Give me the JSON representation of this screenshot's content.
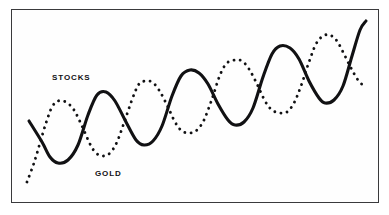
{
  "figure": {
    "name": "stocks-vs-gold-cycle-illustration",
    "background_color": "#ffffff",
    "frame": {
      "border_color": "#3a3a3c",
      "fill_color": "#fefefe",
      "x": 11,
      "y": 9,
      "width": 368,
      "height": 194
    }
  },
  "labels": {
    "stocks": "STOCKS",
    "gold": "GOLD"
  },
  "chart_data": {
    "type": "line",
    "title": "",
    "xlabel": "",
    "ylabel": "",
    "grid": false,
    "legend_position": "inline-annotations",
    "axes_visible": false,
    "tick_labels": [],
    "annotations": [
      {
        "text": "STOCKS",
        "x": 52,
        "y": 78,
        "series": "stocks"
      },
      {
        "text": "GOLD",
        "x": 95,
        "y": 174,
        "series": "gold"
      }
    ],
    "xlim": [
      11,
      379
    ],
    "ylim": [
      203,
      9
    ],
    "series": [
      {
        "name": "STOCKS",
        "style": "solid",
        "color": "#111113",
        "stroke_width": 3.1,
        "points": [
          [
            29,
            121
          ],
          [
            42,
            142
          ],
          [
            50,
            157
          ],
          [
            58,
            163
          ],
          [
            68,
            160
          ],
          [
            78,
            145
          ],
          [
            88,
            115
          ],
          [
            97,
            95
          ],
          [
            106,
            92
          ],
          [
            115,
            101
          ],
          [
            126,
            122
          ],
          [
            136,
            140
          ],
          [
            144,
            145
          ],
          [
            153,
            141
          ],
          [
            162,
            126
          ],
          [
            172,
            96
          ],
          [
            181,
            76
          ],
          [
            190,
            70
          ],
          [
            199,
            73
          ],
          [
            208,
            84
          ],
          [
            218,
            104
          ],
          [
            228,
            120
          ],
          [
            235,
            125
          ],
          [
            244,
            122
          ],
          [
            253,
            108
          ],
          [
            263,
            77
          ],
          [
            272,
            54
          ],
          [
            280,
            46
          ],
          [
            290,
            48
          ],
          [
            299,
            59
          ],
          [
            309,
            81
          ],
          [
            319,
            98
          ],
          [
            325,
            103
          ],
          [
            334,
            100
          ],
          [
            343,
            86
          ],
          [
            352,
            56
          ],
          [
            360,
            30
          ],
          [
            366,
            21
          ]
        ]
      },
      {
        "name": "GOLD",
        "style": "dotted",
        "color": "#111113",
        "dot_diameter": 2.9,
        "dot_gap": 3.4,
        "points": [
          [
            27,
            182
          ],
          [
            34,
            163
          ],
          [
            40,
            143
          ],
          [
            46,
            123
          ],
          [
            52,
            107
          ],
          [
            58,
            101
          ],
          [
            66,
            102
          ],
          [
            74,
            110
          ],
          [
            82,
            126
          ],
          [
            90,
            144
          ],
          [
            96,
            153
          ],
          [
            103,
            156
          ],
          [
            110,
            153
          ],
          [
            117,
            142
          ],
          [
            125,
            120
          ],
          [
            133,
            97
          ],
          [
            139,
            84
          ],
          [
            145,
            81
          ],
          [
            152,
            82
          ],
          [
            159,
            90
          ],
          [
            167,
            105
          ],
          [
            175,
            122
          ],
          [
            182,
            131
          ],
          [
            190,
            133
          ],
          [
            197,
            130
          ],
          [
            204,
            120
          ],
          [
            212,
            99
          ],
          [
            220,
            75
          ],
          [
            227,
            63
          ],
          [
            235,
            60
          ],
          [
            242,
            61
          ],
          [
            249,
            69
          ],
          [
            257,
            84
          ],
          [
            265,
            101
          ],
          [
            272,
            110
          ],
          [
            280,
            113
          ],
          [
            287,
            112
          ],
          [
            294,
            103
          ],
          [
            301,
            86
          ],
          [
            309,
            62
          ],
          [
            316,
            44
          ],
          [
            323,
            36
          ],
          [
            330,
            35
          ],
          [
            337,
            41
          ],
          [
            344,
            54
          ],
          [
            351,
            68
          ],
          [
            358,
            80
          ],
          [
            366,
            88
          ]
        ]
      }
    ]
  }
}
